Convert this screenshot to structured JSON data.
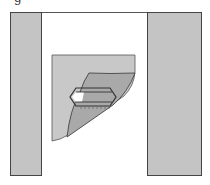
{
  "figure": {
    "caption_fragment": "g",
    "colors": {
      "background": "#ffffff",
      "side_panel": "#c4c4c4",
      "sheet_back": "#c8c8c8",
      "sheet_fold": "#a9a9a9",
      "outline": "#444444",
      "crystal_window": "#ffffff"
    },
    "elements": [
      {
        "name": "left-panel",
        "description": "gray vertical panel"
      },
      {
        "name": "right-panel",
        "description": "gray vertical panel"
      },
      {
        "name": "folded-sheet",
        "description": "sheet with lower-right corner peeled back"
      },
      {
        "name": "crystal",
        "description": "elongated hexagonal prism outline"
      }
    ]
  }
}
